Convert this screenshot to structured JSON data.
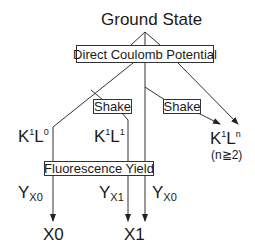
{
  "diagram": {
    "title": "Ground State",
    "process_boxes": {
      "direct_coulomb": "Direct Coulomb Potential",
      "shake_left": "Shake",
      "shake_right": "Shake",
      "fluorescence": "Fluorescence Yield"
    },
    "states": {
      "k1l0": {
        "base1": "K",
        "sup1": "1",
        "base2": "L",
        "sup2": "0"
      },
      "k1l1": {
        "base1": "K",
        "sup1": "1",
        "base2": "L",
        "sup2": "1"
      },
      "k1ln": {
        "base1": "K",
        "sup1": "1",
        "base2": "L",
        "sup2": "n",
        "condition": "(n≧2)"
      }
    },
    "yields": {
      "left": {
        "base": "Y",
        "sub": "X0"
      },
      "mid": {
        "base": "Y",
        "sub": "X1"
      },
      "right": {
        "base": "Y",
        "sub": "X0"
      }
    },
    "outputs": {
      "x0": "X0",
      "x1": "X1"
    }
  }
}
